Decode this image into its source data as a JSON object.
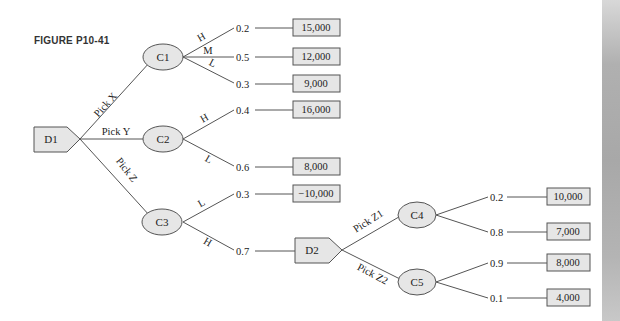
{
  "figure": {
    "title": "FIGURE P10-41"
  },
  "nodes": {
    "D1": {
      "label": "D1",
      "type": "decision"
    },
    "C1": {
      "label": "C1",
      "type": "chance"
    },
    "C2": {
      "label": "C2",
      "type": "chance"
    },
    "C3": {
      "label": "C3",
      "type": "chance"
    },
    "D2": {
      "label": "D2",
      "type": "decision"
    },
    "C4": {
      "label": "C4",
      "type": "chance"
    },
    "C5": {
      "label": "C5",
      "type": "chance"
    }
  },
  "branches": {
    "pick_x": "Pick X",
    "pick_y": "Pick Y",
    "pick_z": "Pick Z",
    "pick_z1": "Pick Z1",
    "pick_z2": "Pick Z2",
    "c1_h": "H",
    "c1_m": "M",
    "c1_l": "L",
    "c2_h": "H",
    "c2_l": "L",
    "c3_l": "L",
    "c3_h": "H"
  },
  "outcomes": [
    {
      "node": "C1",
      "branch": "H",
      "prob": "0.2",
      "value": "15,000"
    },
    {
      "node": "C1",
      "branch": "M",
      "prob": "0.5",
      "value": "12,000"
    },
    {
      "node": "C1",
      "branch": "L",
      "prob": "0.3",
      "value": "9,000"
    },
    {
      "node": "C2",
      "branch": "H",
      "prob": "0.4",
      "value": "16,000"
    },
    {
      "node": "C2",
      "branch": "L",
      "prob": "0.6",
      "value": "8,000"
    },
    {
      "node": "C3",
      "branch": "L",
      "prob": "0.3",
      "value": "−10,000"
    },
    {
      "node": "C3",
      "branch": "H",
      "prob": "0.7",
      "value": "D2"
    },
    {
      "node": "C4",
      "branch": "",
      "prob": "0.2",
      "value": "10,000"
    },
    {
      "node": "C4",
      "branch": "",
      "prob": "0.8",
      "value": "7,000"
    },
    {
      "node": "C5",
      "branch": "",
      "prob": "0.9",
      "value": "8,000"
    },
    {
      "node": "C5",
      "branch": "",
      "prob": "0.1",
      "value": "4,000"
    }
  ],
  "colors": {
    "node_fill": "#e6e6e6",
    "stroke": "#555555",
    "text": "#222222"
  }
}
